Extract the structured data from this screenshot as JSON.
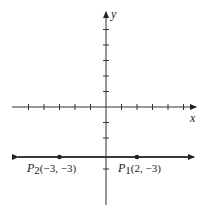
{
  "diagram": {
    "type": "coordinate-plane",
    "x_axis_label": "x",
    "y_axis_label": "y",
    "x_tick_range": [
      -5,
      5
    ],
    "y_tick_range": [
      -4,
      5
    ],
    "line": {
      "equation": "y = -3",
      "style": "double-arrow"
    },
    "points": [
      {
        "name": "P",
        "sub": "2",
        "label_rest": "(−3, −3)",
        "x": -3,
        "y": -3
      },
      {
        "name": "P",
        "sub": "1",
        "label_rest": "(2, −3)",
        "x": 2,
        "y": -3
      }
    ],
    "colors": {
      "ink": "#222222",
      "line": "#3a3a3a"
    }
  }
}
